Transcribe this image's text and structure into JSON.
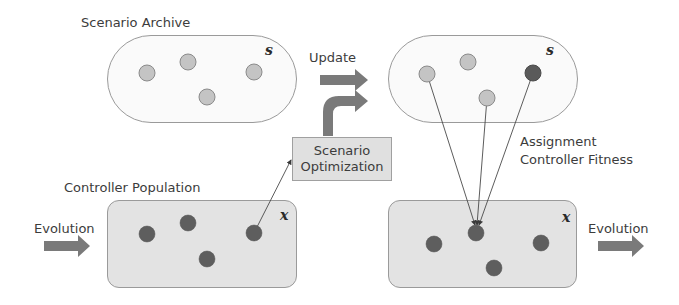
{
  "diagram": {
    "labels": {
      "scenario_archive": "Scenario Archive",
      "update": "Update",
      "controller_population": "Controller Population",
      "evolution_left": "Evolution",
      "evolution_right": "Evolution",
      "scenario_optimization_line1": "Scenario",
      "scenario_optimization_line2": "Optimization",
      "assignment_line1": "Assignment",
      "assignment_line2": "Controller Fitness"
    },
    "variables": {
      "scenario_set_left": "s",
      "scenario_set_right": "s",
      "controller_set_left": "x",
      "controller_set_right": "x"
    },
    "colors": {
      "scenario_node": "#c4c4c4",
      "scenario_node_highlight": "#5a5a5a",
      "controller_node": "#5e5e5e",
      "arrow_fill": "#7a7a7a",
      "population_box": "#e3e3e3",
      "archive_fill": "#fafafa"
    },
    "nodes": {
      "archive_left": [
        [
          147,
          73
        ],
        [
          188,
          62
        ],
        [
          254,
          72
        ],
        [
          207,
          97
        ]
      ],
      "archive_right": [
        [
          427,
          74
        ],
        [
          468,
          62
        ],
        [
          533,
          73
        ],
        [
          487,
          98
        ]
      ],
      "population_left": [
        [
          147,
          234
        ],
        [
          188,
          223
        ],
        [
          254,
          233
        ],
        [
          207,
          259
        ]
      ],
      "population_right": [
        [
          434,
          244
        ],
        [
          476,
          233
        ],
        [
          541,
          243
        ],
        [
          494,
          268
        ]
      ]
    }
  }
}
